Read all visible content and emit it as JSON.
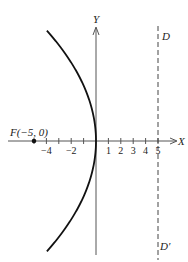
{
  "diagram": {
    "type": "parabola",
    "equation": "y^2 = -20x",
    "vertex": [
      0,
      0
    ],
    "focus": {
      "x": -5,
      "y": 0,
      "label": "F(−5, 0)"
    },
    "directrix": {
      "x": 5,
      "top_label": "D",
      "bottom_label": "D′"
    },
    "axes": {
      "x_label": "X",
      "y_label": "Y",
      "x_ticks": [
        -5,
        -4,
        -3,
        -2,
        -1,
        1,
        2,
        3,
        4,
        5
      ],
      "x_tick_labels": [
        {
          "value": -4,
          "text": "−4"
        },
        {
          "value": -2,
          "text": "−2"
        },
        {
          "value": 1,
          "text": "1"
        },
        {
          "value": 2,
          "text": "2"
        },
        {
          "value": 3,
          "text": "3"
        },
        {
          "value": 4,
          "text": "4"
        },
        {
          "value": 5,
          "text": "5"
        }
      ]
    },
    "colors": {
      "curve": "#111111",
      "axis": "#555555",
      "directrix": "#444444"
    }
  }
}
